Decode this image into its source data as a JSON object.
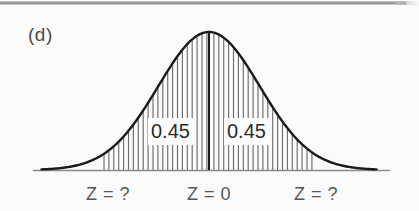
{
  "figure": {
    "panel_label": "(d)",
    "background_color": "#fbfbfb",
    "curve_color": "#1a1a1a",
    "axis_color": "#8a8a8a",
    "hatch_color": "#6d6d6d",
    "center_line_color": "#1a1a1a",
    "text_color": "#2b2b2b",
    "caption_color": "#555555"
  },
  "areas": {
    "left_label": "0.45",
    "right_label": "0.45"
  },
  "axis": {
    "left_caption": "Z = ?",
    "center_caption": "Z = 0",
    "right_caption": "Z = ?"
  },
  "chart_data": {
    "type": "area",
    "title": "(d)",
    "xlabel": "",
    "ylabel": "",
    "distribution": "standard normal",
    "mean": 0,
    "std": 1,
    "grid": false,
    "legend": null,
    "curve_points_px": {
      "baseline_y": 170,
      "peak_x": 209,
      "peak_y": 32,
      "left_tail_x": 40,
      "right_tail_x": 375,
      "axis_start_x": 33,
      "axis_end_x": 390
    },
    "shaded_regions": [
      {
        "name": "left-shaded-area",
        "label": "0.45",
        "value": 0.45,
        "from": "Z = ?",
        "to": "Z = 0",
        "x_start_px": 104,
        "x_end_px": 209
      },
      {
        "name": "right-shaded-area",
        "label": "0.45",
        "value": 0.45,
        "from": "Z = 0",
        "to": "Z = ?",
        "x_start_px": 209,
        "x_end_px": 313
      }
    ],
    "total_shaded": 0.9,
    "tick_labels": [
      "Z = ?",
      "Z = 0",
      "Z = ?"
    ],
    "annotations": [
      "0.45",
      "0.45"
    ]
  }
}
